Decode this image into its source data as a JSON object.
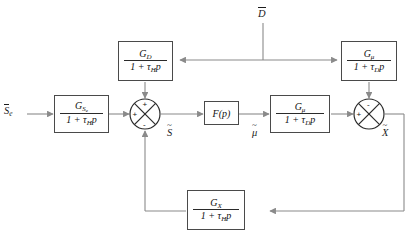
{
  "diagram": {
    "type": "control-block-diagram",
    "line_color": "#8a8a8a",
    "block_border_color": "#4a4a4a",
    "text_color": "#1c1c1c",
    "background": "#ffffff"
  },
  "inputs": {
    "setpoint_label": "S",
    "setpoint_sub": "e",
    "disturbance_label": "D"
  },
  "outputs": {
    "output_label": "X"
  },
  "signals": {
    "error_label": "S",
    "control_label": "μ"
  },
  "blocks": {
    "input_gain": {
      "name": "G_Se",
      "numerator": "G",
      "numerator_sub": "S",
      "numerator_sub2": "e",
      "denominator": "1 + τ",
      "denominator_sub": "H",
      "denominator_tail": "p"
    },
    "disturbance_feedforward": {
      "name": "G_D",
      "numerator": "G",
      "numerator_sub": "D",
      "denominator": "1 + τ",
      "denominator_sub": "H",
      "denominator_tail": "p"
    },
    "disturbance_actuator": {
      "name": "G_mu_top",
      "numerator": "G",
      "numerator_sub": "μ",
      "denominator": "1 + τ",
      "denominator_sub": "D",
      "denominator_tail": "p"
    },
    "controller": {
      "name": "F(p)",
      "label": "F(p)"
    },
    "actuator": {
      "name": "G_mu",
      "numerator": "G",
      "numerator_sub": "μ",
      "denominator": "1 + τ",
      "denominator_sub": "D",
      "denominator_tail": "p"
    },
    "feedback": {
      "name": "G_X",
      "numerator": "G",
      "numerator_sub": "X",
      "denominator": "1 + τ",
      "denominator_sub": "H",
      "denominator_tail": "p"
    }
  },
  "summing_junctions": {
    "left": {
      "name": "left-summing-junction",
      "top_sign": "+",
      "left_sign": "+",
      "bottom_sign": "-"
    },
    "right": {
      "name": "right-summing-junction",
      "top_sign": "-",
      "left_sign": "+"
    }
  }
}
